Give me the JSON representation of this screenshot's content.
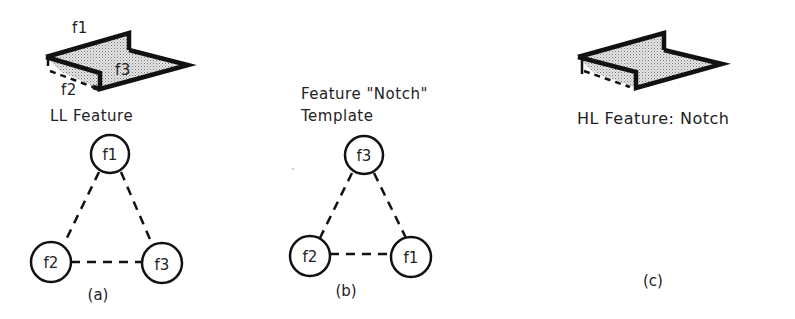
{
  "panels": [
    {
      "id": "a",
      "caption": "(a)",
      "title": "LL Feature",
      "shape_labels": {
        "top": "f1",
        "side": "f2",
        "floor": "f3"
      },
      "graph": {
        "nodes": [
          {
            "id": "f1",
            "label": "f1",
            "position": "top"
          },
          {
            "id": "f2",
            "label": "f2",
            "position": "bottom-left"
          },
          {
            "id": "f3",
            "label": "f3",
            "position": "bottom-right"
          }
        ],
        "edges": [
          {
            "from": "f1",
            "to": "f2",
            "style": "dashed"
          },
          {
            "from": "f1",
            "to": "f3",
            "style": "dashed"
          },
          {
            "from": "f2",
            "to": "f3",
            "style": "dashed"
          }
        ]
      }
    },
    {
      "id": "b",
      "caption": "(b)",
      "title_line1": "Feature \"Notch\"",
      "title_line2": "Template",
      "graph": {
        "nodes": [
          {
            "id": "f3",
            "label": "f3",
            "position": "top"
          },
          {
            "id": "f2",
            "label": "f2",
            "position": "bottom-left"
          },
          {
            "id": "f1",
            "label": "f1",
            "position": "bottom-right"
          }
        ],
        "edges": [
          {
            "from": "f3",
            "to": "f2",
            "style": "dashed"
          },
          {
            "from": "f3",
            "to": "f1",
            "style": "dashed"
          },
          {
            "from": "f2",
            "to": "f1",
            "style": "dashed"
          }
        ]
      }
    },
    {
      "id": "c",
      "caption": "(c)",
      "title": "HL Feature: Notch"
    }
  ],
  "colors": {
    "ink": "#111111",
    "fill_stipple": "#c8c8c8",
    "background": "#ffffff"
  }
}
